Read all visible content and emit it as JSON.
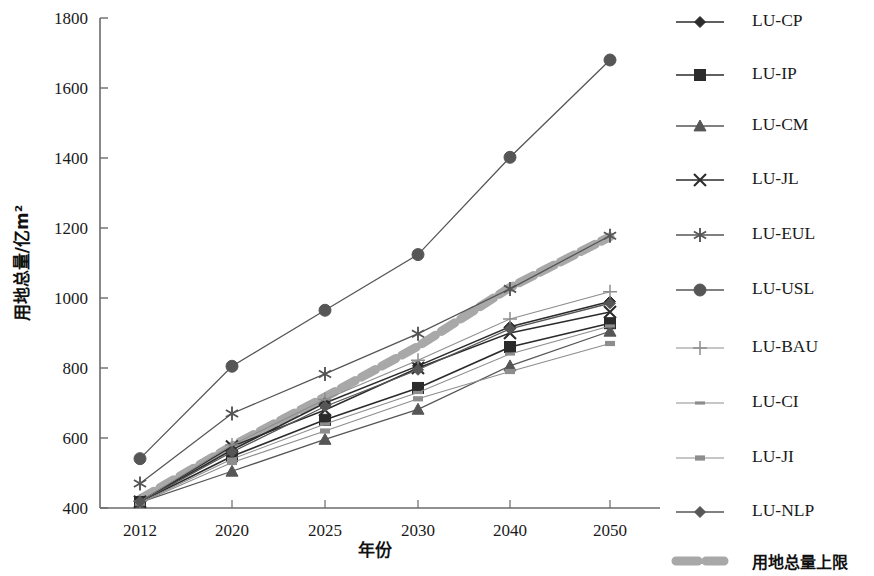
{
  "chart_data": {
    "type": "line",
    "title": "",
    "xlabel": "年份",
    "ylabel": "用地总量/亿m²",
    "categories": [
      "2012",
      "2020",
      "2025",
      "2030",
      "2040",
      "2050"
    ],
    "x": [
      2012,
      2020,
      2025,
      2030,
      2040,
      2050
    ],
    "ylim": [
      400,
      1800
    ],
    "ytick_labels": [
      "400",
      "600",
      "800",
      "1000",
      "1200",
      "1400",
      "1600",
      "1800"
    ],
    "ytick_values": [
      400,
      600,
      800,
      1000,
      1200,
      1400,
      1600,
      1800
    ],
    "grid": false,
    "legend_position": "right",
    "series": [
      {
        "name": "LU-CP",
        "marker": "diamond",
        "values": [
          418,
          566,
          700,
          806,
          918,
          990
        ]
      },
      {
        "name": "LU-IP",
        "marker": "square",
        "values": [
          417,
          548,
          652,
          743,
          860,
          928
        ]
      },
      {
        "name": "LU-CM",
        "marker": "triangle",
        "values": [
          416,
          505,
          596,
          682,
          806,
          905
        ]
      },
      {
        "name": "LU-JL",
        "marker": "cross",
        "values": [
          418,
          576,
          680,
          800,
          900,
          960
        ]
      },
      {
        "name": "LU-EUL",
        "marker": "asterisk",
        "values": [
          470,
          670,
          783,
          898,
          1026,
          1178
        ]
      },
      {
        "name": "LU-USL",
        "marker": "circle",
        "values": [
          541,
          805,
          965,
          1124,
          1402,
          1680
        ]
      },
      {
        "name": "LU-BAU",
        "marker": "plus",
        "values": [
          419,
          580,
          710,
          822,
          940,
          1018
        ]
      },
      {
        "name": "LU-CI",
        "marker": "dash",
        "values": [
          415,
          540,
          640,
          730,
          840,
          920
        ]
      },
      {
        "name": "LU-JI",
        "marker": "bar",
        "values": [
          414,
          530,
          620,
          712,
          790,
          870
        ]
      },
      {
        "name": "LU-NLP",
        "marker": "diamond2",
        "values": [
          418,
          560,
          690,
          795,
          912,
          985
        ]
      }
    ],
    "reference_line": {
      "name": "用地总量上限",
      "style": "thick-dotted",
      "values": [
        425,
        577,
        717,
        862,
        1030,
        1175
      ]
    },
    "colors": {
      "axis": "#6b6b6b",
      "text": "#1a1a1a",
      "dark_line": "#2b2b2b",
      "mid_line": "#565656",
      "light_line": "#8d8d8d",
      "reference": "#a8a8a8"
    }
  },
  "legend": {
    "items": [
      {
        "label": "LU-CP",
        "marker": "diamond"
      },
      {
        "label": "LU-IP",
        "marker": "square"
      },
      {
        "label": "LU-CM",
        "marker": "triangle"
      },
      {
        "label": "LU-JL",
        "marker": "cross"
      },
      {
        "label": "LU-EUL",
        "marker": "asterisk"
      },
      {
        "label": "LU-USL",
        "marker": "circle"
      },
      {
        "label": "LU-BAU",
        "marker": "plus"
      },
      {
        "label": "LU-CI",
        "marker": "dash"
      },
      {
        "label": "LU-JI",
        "marker": "bar"
      },
      {
        "label": "LU-NLP",
        "marker": "diamond2"
      },
      {
        "label": "用地总量上限",
        "marker": "thick-dotted"
      }
    ]
  }
}
